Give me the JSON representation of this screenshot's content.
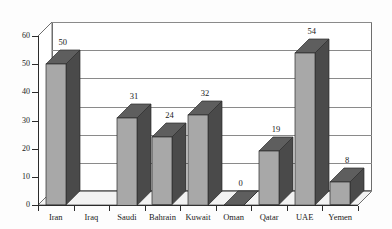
{
  "chart_data": {
    "type": "bar",
    "title": "",
    "subtitle": "",
    "xlabel": "",
    "ylabel": "",
    "categories": [
      "Iran",
      "Iraq",
      "Saudi",
      "Bahrain",
      "Kuwait",
      "Oman",
      "Qatar",
      "UAE",
      "Yemen"
    ],
    "values": [
      50,
      null,
      31,
      24,
      32,
      0,
      19,
      54,
      8
    ],
    "data_labels": [
      "50",
      "",
      "31",
      "24",
      "32",
      "0",
      "19",
      "54",
      "8"
    ],
    "ylim": [
      0,
      60
    ],
    "ytick_values": [
      0,
      10,
      20,
      30,
      40,
      50,
      60
    ],
    "ytick_labels": [
      "0",
      "10",
      "20",
      "30",
      "40",
      "50",
      "60"
    ],
    "grid": true,
    "grid_axis": "y",
    "legend": false,
    "style": "3d-column-grayscale",
    "colors": {
      "bar_front": "#a8a8a8",
      "bar_side": "#4a4a4a",
      "bar_top": "#5e5e5e",
      "grid": "#8a8a8a",
      "axis": "#2b2b2b",
      "background": "#fdfdfd",
      "text": "#1a1a1a"
    }
  }
}
